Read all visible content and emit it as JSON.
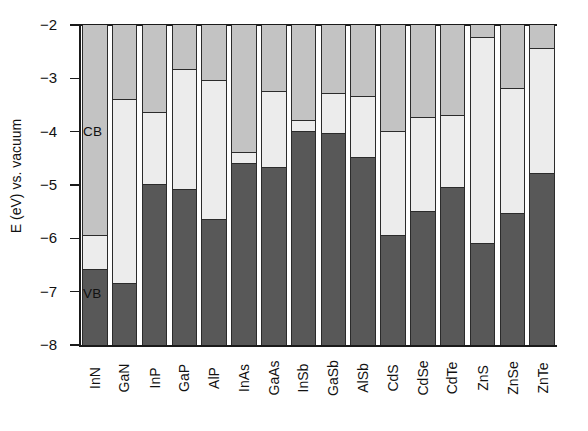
{
  "chart_data": {
    "type": "bar",
    "title": "",
    "subtitle": "",
    "xlabel": "",
    "ylabel": "E (eV) vs. vacuum",
    "ylim": [
      -8,
      -2
    ],
    "ytick_labels": [
      "-2",
      "-3",
      "-4",
      "-5",
      "-6",
      "-7",
      "-8"
    ],
    "ytick_values": [
      -2,
      -3,
      -4,
      -5,
      -6,
      -7,
      -8
    ],
    "grid": false,
    "legend_position": "in-plot",
    "annotations": [
      {
        "name": "CB",
        "text": "CB",
        "meaning": "conduction band region"
      },
      {
        "name": "VB",
        "text": "VB",
        "meaning": "valence band region"
      }
    ],
    "series_description": "Each bar is a semiconductor: the medium-gray top segment extends from the plot top (-2 eV) down to the conduction band minimum (CBM); the light segment is the band gap between CBM and the valence band maximum (VBM); the dark segment extends from the VBM down to the plot bottom (-8 eV).",
    "categories": [
      "InN",
      "GaN",
      "InP",
      "GaP",
      "AlP",
      "InAs",
      "GaAs",
      "InSb",
      "GaSb",
      "AlSb",
      "CdS",
      "CdSe",
      "CdTe",
      "ZnS",
      "ZnSe",
      "ZnTe"
    ],
    "series": [
      {
        "name": "CBM (eV)",
        "values": [
          -5.95,
          -3.4,
          -3.65,
          -2.85,
          -3.05,
          -4.4,
          -3.25,
          -3.8,
          -3.3,
          -3.35,
          -4.0,
          -3.75,
          -3.7,
          -2.25,
          -3.2,
          -2.45
        ]
      },
      {
        "name": "VBM (eV)",
        "values": [
          -6.6,
          -6.85,
          -5.0,
          -5.1,
          -5.65,
          -4.6,
          -4.68,
          -4.0,
          -4.05,
          -4.5,
          -5.95,
          -5.5,
          -5.05,
          -6.1,
          -5.55,
          -4.8
        ]
      },
      {
        "name": "Band gap (eV)",
        "values": [
          0.65,
          3.45,
          1.35,
          2.25,
          2.6,
          0.2,
          1.43,
          0.2,
          0.75,
          1.15,
          1.95,
          1.75,
          1.35,
          3.85,
          2.35,
          2.35
        ]
      }
    ],
    "colors": {
      "cb_fill": "#c3c3c3",
      "gap_fill": "#ececec",
      "vb_fill": "#585858",
      "outline": "#2b2b2b",
      "axis": "#1a1a1a",
      "background": "#ffffff",
      "text": "#111111"
    }
  }
}
